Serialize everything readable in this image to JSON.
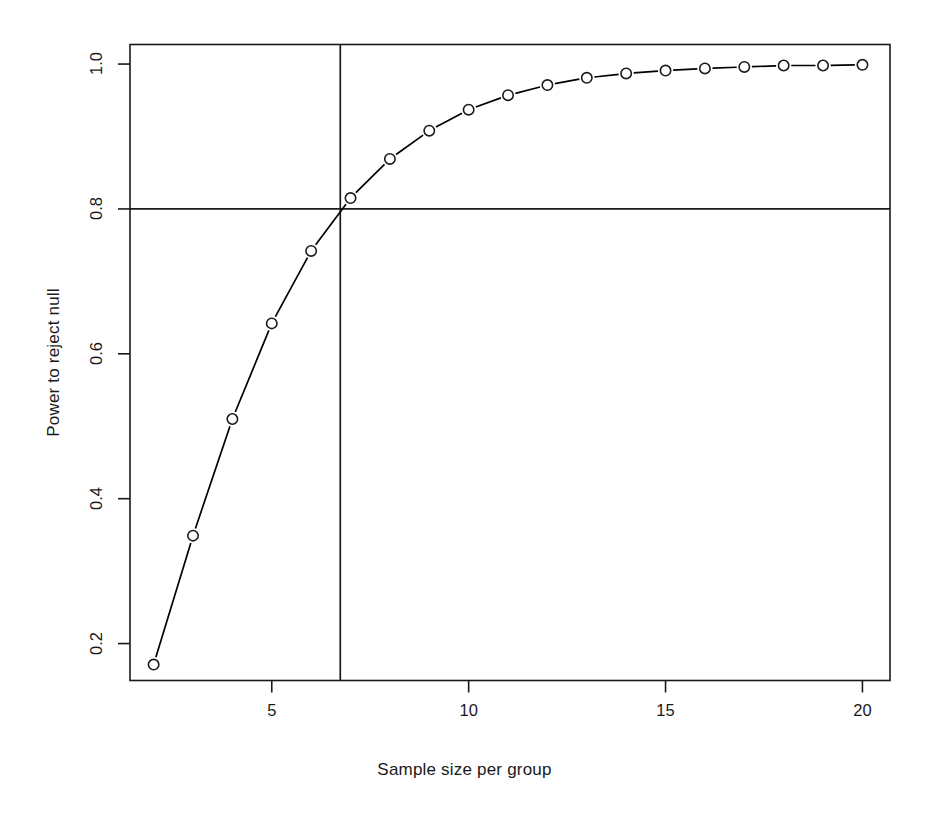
{
  "chart_data": {
    "type": "line",
    "title": "",
    "subtitle": "",
    "xlabel": "Sample size per group",
    "ylabel": "Power to reject null",
    "x": [
      2,
      3,
      4,
      5,
      6,
      7,
      8,
      9,
      10,
      11,
      12,
      13,
      14,
      15,
      16,
      17,
      18,
      19,
      20
    ],
    "values": [
      0.171,
      0.349,
      0.51,
      0.642,
      0.742,
      0.815,
      0.869,
      0.908,
      0.937,
      0.957,
      0.971,
      0.981,
      0.987,
      0.991,
      0.994,
      0.996,
      0.998,
      0.998,
      0.999
    ],
    "series": [
      {
        "name": "Power",
        "values": [
          0.171,
          0.349,
          0.51,
          0.642,
          0.742,
          0.815,
          0.869,
          0.908,
          0.937,
          0.957,
          0.971,
          0.981,
          0.987,
          0.991,
          0.994,
          0.996,
          0.998,
          0.998,
          0.999
        ]
      }
    ],
    "xlim": [
      1.4,
      20.7
    ],
    "ylim": [
      0.149,
      1.027
    ],
    "xticks": [
      5,
      10,
      15,
      20
    ],
    "xtick_labels": [
      "5",
      "10",
      "15",
      "20"
    ],
    "yticks": [
      0.2,
      0.4,
      0.6,
      0.8,
      1.0
    ],
    "ytick_labels": [
      "0.2",
      "0.4",
      "0.6",
      "0.8",
      "1.0"
    ],
    "grid": false,
    "legend": "none",
    "marker": "open-circle",
    "line_style": "solid",
    "line_color": "#000000",
    "reference_lines": [
      {
        "orientation": "horizontal",
        "value": 0.8,
        "label": "power = 0.8"
      },
      {
        "orientation": "vertical",
        "value": 6.74,
        "label": "required n"
      }
    ]
  },
  "axes": {
    "x_title": "Sample size per group",
    "y_title": "Power to reject null",
    "x_tick_labels": [
      "5",
      "10",
      "15",
      "20"
    ],
    "y_tick_labels": [
      "0.2",
      "0.4",
      "0.6",
      "0.8",
      "1.0"
    ]
  },
  "colors": {
    "background": "#ffffff",
    "foreground": "#1a1a1a",
    "line": "#000000",
    "marker_stroke": "#1a1a1a"
  }
}
